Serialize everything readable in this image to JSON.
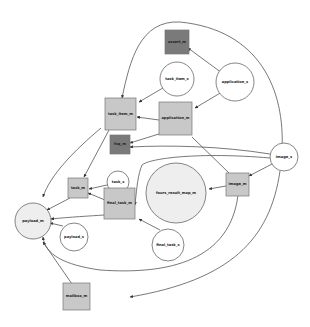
{
  "diagram": {
    "type": "directed-graph",
    "colors": {
      "dark_node": "#7a7a7a",
      "light_node": "#c8c8c8",
      "circle_fill": "#ffffff",
      "edge": "#555555"
    },
    "nodes": [
      {
        "id": "assert_m",
        "label": "assert_m",
        "shape": "box",
        "fill": "#7a7a7a"
      },
      {
        "id": "task_item_s",
        "label": "task_item_s",
        "shape": "circle"
      },
      {
        "id": "application_s",
        "label": "application_s",
        "shape": "circle"
      },
      {
        "id": "task_item_m",
        "label": "task_item_m",
        "shape": "box",
        "fill": "#c8c8c8"
      },
      {
        "id": "application_m",
        "label": "application_m",
        "shape": "box",
        "fill": "#c8c8c8"
      },
      {
        "id": "fsq_m",
        "label": "fsq_m",
        "shape": "box",
        "fill": "#7a7a7a"
      },
      {
        "id": "image_s",
        "label": "image_s",
        "shape": "circle"
      },
      {
        "id": "task_s",
        "label": "task_s",
        "shape": "circle"
      },
      {
        "id": "task_m",
        "label": "task_m",
        "shape": "box",
        "fill": "#c8c8c8"
      },
      {
        "id": "fours_result_map_m",
        "label": "fours_result_map_m",
        "shape": "circle",
        "fill": "#eeeeee"
      },
      {
        "id": "image_m",
        "label": "image_m",
        "shape": "box",
        "fill": "#c8c8c8"
      },
      {
        "id": "final_task_m",
        "label": "final_task_m",
        "shape": "box",
        "fill": "#c8c8c8"
      },
      {
        "id": "payload_m",
        "label": "payload_m",
        "shape": "circle",
        "fill": "#eeeeee"
      },
      {
        "id": "payload_s",
        "label": "payload_s",
        "shape": "circle"
      },
      {
        "id": "final_task_s",
        "label": "final_task_s",
        "shape": "circle"
      },
      {
        "id": "mailbox_m",
        "label": "mailbox_m",
        "shape": "box",
        "fill": "#c8c8c8"
      }
    ],
    "edges": [
      {
        "from": "application_s",
        "to": "assert_m"
      },
      {
        "from": "application_s",
        "to": "task_item_m"
      },
      {
        "from": "application_s",
        "to": "application_m"
      },
      {
        "from": "task_item_s",
        "to": "task_item_m"
      },
      {
        "from": "application_m",
        "to": "task_item_m"
      },
      {
        "from": "application_m",
        "to": "fsq_m"
      },
      {
        "from": "image_s",
        "to": "fsq_m"
      },
      {
        "from": "image_s",
        "to": "image_m"
      },
      {
        "from": "image_s",
        "to": "final_task_m"
      },
      {
        "from": "image_s",
        "to": "mailbox_m"
      },
      {
        "from": "image_m",
        "to": "application_m"
      },
      {
        "from": "image_m",
        "to": "fours_result_map_m"
      },
      {
        "from": "image_m",
        "to": "payload_m"
      },
      {
        "from": "task_item_m",
        "to": "task_m"
      },
      {
        "from": "task_item_m",
        "to": "payload_m"
      },
      {
        "from": "task_s",
        "to": "task_m"
      },
      {
        "from": "task_m",
        "to": "payload_m"
      },
      {
        "from": "final_task_m",
        "to": "task_m"
      },
      {
        "from": "final_task_m",
        "to": "payload_m"
      },
      {
        "from": "final_task_s",
        "to": "final_task_m"
      },
      {
        "from": "payload_s",
        "to": "payload_m"
      },
      {
        "from": "mailbox_m",
        "to": "payload_m"
      }
    ]
  }
}
